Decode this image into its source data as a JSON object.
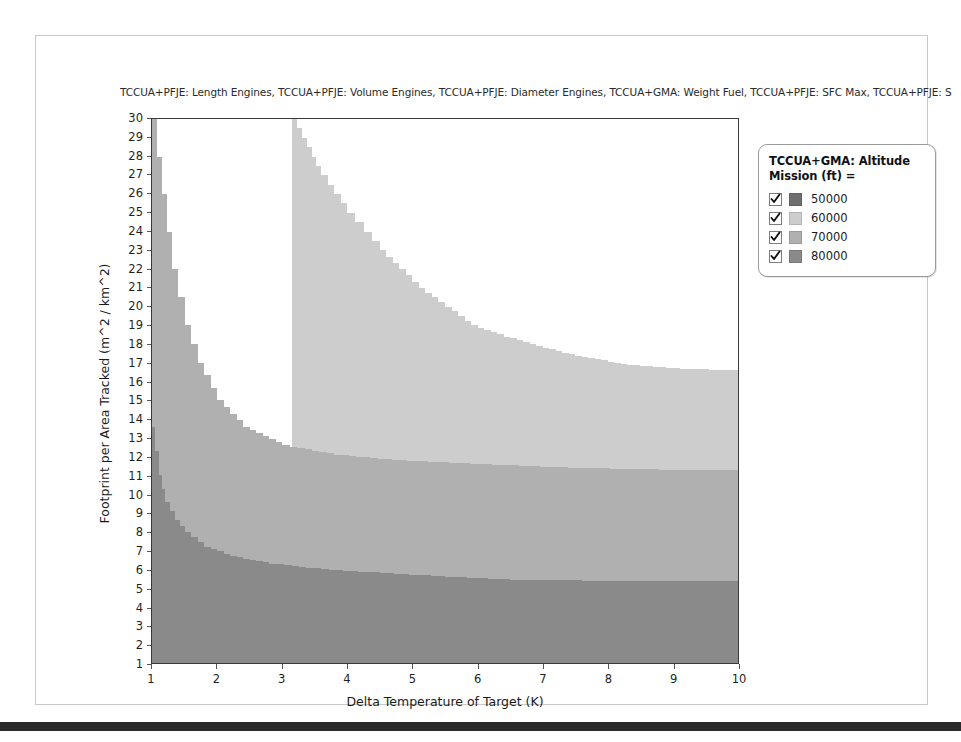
{
  "window": {
    "background_color": "#ffffff",
    "card_border_color": "#c9c9c9",
    "bottom_bar_color": "#2b2b2b"
  },
  "supertitle": "TCCUA+PFJE: Length Engines, TCCUA+PFJE: Volume Engines, TCCUA+PFJE: Diameter Engines, TCCUA+GMA: Weight Fuel, TCCUA+PFJE: SFC Max, TCCUA+PFJE: S",
  "legend": {
    "title": "TCCUA+GMA: Altitude Mission (ft) =",
    "title_line1": "TCCUA+GMA: Altitude",
    "title_line2": "Mission (ft) =",
    "items": [
      {
        "label": "50000",
        "color": "#6f6f6f",
        "checked": true
      },
      {
        "label": "60000",
        "color": "#cdcdcd",
        "checked": true
      },
      {
        "label": "70000",
        "color": "#b0b0b0",
        "checked": true
      },
      {
        "label": "80000",
        "color": "#8a8a8a",
        "checked": true
      }
    ]
  },
  "chart_data": {
    "type": "heatmap",
    "title": "TCCUA+PFJE: Length Engines, TCCUA+PFJE: Volume Engines, TCCUA+PFJE: Diameter Engines, TCCUA+GMA: Weight Fuel, TCCUA+PFJE: SFC Max, TCCUA+PFJE: S",
    "xlabel": "Delta Temperature of Target (K)",
    "ylabel": "Footprint per Area Tracked (m^2 / km^2)",
    "xlim": [
      1,
      10
    ],
    "ylim": [
      1,
      30
    ],
    "xticks": [
      1,
      2,
      3,
      4,
      5,
      6,
      7,
      8,
      9,
      10
    ],
    "yticks": [
      1,
      2,
      3,
      4,
      5,
      6,
      7,
      8,
      9,
      10,
      11,
      12,
      13,
      14,
      15,
      16,
      17,
      18,
      19,
      20,
      21,
      22,
      23,
      24,
      25,
      26,
      27,
      28,
      29,
      30
    ],
    "grid": false,
    "legend_position": "right",
    "legend_title": "TCCUA+GMA: Altitude Mission (ft) =",
    "categories": [
      "50000",
      "60000",
      "70000",
      "80000"
    ],
    "colors": [
      "#6f6f6f",
      "#cdcdcd",
      "#b0b0b0",
      "#8a8a8a"
    ],
    "region_colors": {
      "infeasible": "#ffffff",
      "band_60000": "#cdcdcd",
      "band_70000": "#b0b0b0",
      "band_80000": "#8a8a8a"
    },
    "boundaries": [
      {
        "name": "infeasible-boundary",
        "between": [
          "60000",
          "infeasible"
        ],
        "points": [
          [
            3.15,
            30.0
          ],
          [
            3.3,
            29.0
          ],
          [
            3.45,
            28.0
          ],
          [
            3.6,
            27.0
          ],
          [
            3.8,
            26.0
          ],
          [
            4.0,
            25.0
          ],
          [
            4.25,
            24.0
          ],
          [
            4.5,
            23.0
          ],
          [
            4.8,
            22.0
          ],
          [
            5.1,
            21.0
          ],
          [
            5.5,
            20.0
          ],
          [
            5.9,
            19.0
          ],
          [
            6.4,
            18.4
          ],
          [
            7.0,
            17.8
          ],
          [
            7.6,
            17.3
          ],
          [
            8.3,
            16.9
          ],
          [
            9.0,
            16.7
          ],
          [
            10.0,
            16.6
          ]
        ]
      },
      {
        "name": "band-60000-to-70000",
        "between": [
          "60000",
          "70000"
        ],
        "points": [
          [
            1.0,
            30.0
          ],
          [
            1.15,
            26.0
          ],
          [
            1.3,
            22.0
          ],
          [
            1.5,
            19.0
          ],
          [
            1.7,
            17.0
          ],
          [
            2.0,
            15.0
          ],
          [
            2.4,
            13.6
          ],
          [
            3.0,
            12.6
          ],
          [
            3.8,
            12.1
          ],
          [
            4.8,
            11.8
          ],
          [
            6.0,
            11.6
          ],
          [
            7.5,
            11.4
          ],
          [
            9.0,
            11.3
          ],
          [
            10.0,
            11.3
          ]
        ]
      },
      {
        "name": "band-70000-to-80000",
        "between": [
          "70000",
          "80000"
        ],
        "points": [
          [
            1.0,
            13.6
          ],
          [
            1.1,
            11.0
          ],
          [
            1.2,
            9.6
          ],
          [
            1.35,
            8.6
          ],
          [
            1.5,
            8.0
          ],
          [
            1.8,
            7.2
          ],
          [
            2.2,
            6.7
          ],
          [
            2.8,
            6.3
          ],
          [
            3.6,
            6.0
          ],
          [
            4.5,
            5.8
          ],
          [
            5.5,
            5.6
          ],
          [
            6.5,
            5.45
          ],
          [
            7.5,
            5.4
          ],
          [
            8.5,
            5.35
          ],
          [
            10.0,
            5.35
          ]
        ]
      }
    ]
  }
}
